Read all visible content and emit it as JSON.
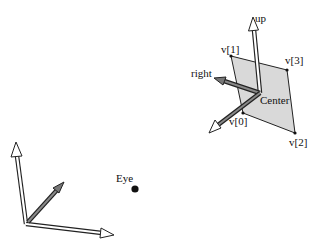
{
  "diagram": {
    "labels": {
      "up": "up",
      "right": "right",
      "center": "Center",
      "eye": "Eye",
      "v0": "v[0]",
      "v1": "v[1]",
      "v2": "v[2]",
      "v3": "v[3]"
    },
    "colors": {
      "plane_fill": "#d9d9d9",
      "stroke": "#222222",
      "arrow_fill": "#ffffff",
      "eye_dot": "#111111"
    }
  }
}
